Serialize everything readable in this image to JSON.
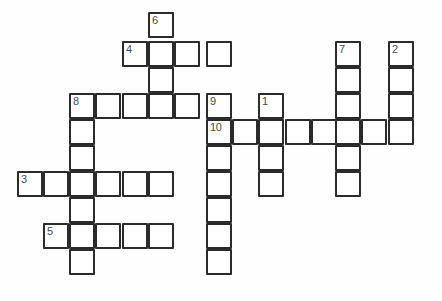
{
  "puzzle": {
    "title": "Crossword Grid",
    "type": "crossword",
    "canvas": {
      "width": 442,
      "height": 301,
      "background": "#fefefe"
    },
    "cell": {
      "size": 26,
      "pitch_x": 26.3,
      "pitch_y": 26.2,
      "border_color": "#2b2b2b",
      "fill_color": "#ffffff",
      "number_color": "#4a4a4a"
    },
    "origin": {
      "x": 17,
      "y": 12
    },
    "columns_px": [
      17,
      43,
      69,
      95,
      122,
      148,
      174,
      206,
      232,
      258,
      285,
      311,
      335,
      361,
      388
    ],
    "rows_px": [
      12,
      41,
      67,
      93,
      119,
      145,
      171,
      197,
      223,
      249
    ],
    "numbers_visible": [
      "1",
      "2",
      "3",
      "4",
      "5",
      "6",
      "7",
      "8",
      "9",
      "10"
    ],
    "entries": [
      {
        "number": "6",
        "direction": "down",
        "start": {
          "col": 5,
          "row": 0
        },
        "length": 3
      },
      {
        "number": "4",
        "direction": "across",
        "start": {
          "col": 4,
          "row": 1
        },
        "length": 4
      },
      {
        "number": "7",
        "direction": "down",
        "start": {
          "col": 12,
          "row": 1
        },
        "length": 6
      },
      {
        "number": "2",
        "direction": "down",
        "start": {
          "col": 14,
          "row": 1
        },
        "length": 4
      },
      {
        "number": "8",
        "direction": "across",
        "start": {
          "col": 2,
          "row": 3
        },
        "length": 5
      },
      {
        "number": "8",
        "direction": "down",
        "start": {
          "col": 2,
          "row": 3
        },
        "length": 7
      },
      {
        "number": "9",
        "direction": "down",
        "start": {
          "col": 7,
          "row": 3
        },
        "length": 7
      },
      {
        "number": "1",
        "direction": "down",
        "start": {
          "col": 9,
          "row": 3
        },
        "length": 4
      },
      {
        "number": "10",
        "direction": "across",
        "start": {
          "col": 7,
          "row": 4
        },
        "length": 8
      },
      {
        "number": "3",
        "direction": "across",
        "start": {
          "col": 0,
          "row": 6
        },
        "length": 6
      },
      {
        "number": "5",
        "direction": "across",
        "start": {
          "col": 1,
          "row": 8
        },
        "length": 5
      }
    ],
    "cells": [
      {
        "col": 5,
        "row": 0,
        "number": "6",
        "letter": ""
      },
      {
        "col": 4,
        "row": 1,
        "number": "4",
        "letter": ""
      },
      {
        "col": 5,
        "row": 1,
        "number": "",
        "letter": ""
      },
      {
        "col": 6,
        "row": 1,
        "number": "",
        "letter": ""
      },
      {
        "col": 7,
        "row": 1,
        "number": "",
        "letter": ""
      },
      {
        "col": 12,
        "row": 1,
        "number": "7",
        "letter": ""
      },
      {
        "col": 14,
        "row": 1,
        "number": "2",
        "letter": ""
      },
      {
        "col": 5,
        "row": 2,
        "number": "",
        "letter": ""
      },
      {
        "col": 12,
        "row": 2,
        "number": "",
        "letter": ""
      },
      {
        "col": 14,
        "row": 2,
        "number": "",
        "letter": ""
      },
      {
        "col": 2,
        "row": 3,
        "number": "8",
        "letter": ""
      },
      {
        "col": 3,
        "row": 3,
        "number": "",
        "letter": ""
      },
      {
        "col": 4,
        "row": 3,
        "number": "",
        "letter": ""
      },
      {
        "col": 5,
        "row": 3,
        "number": "",
        "letter": ""
      },
      {
        "col": 6,
        "row": 3,
        "number": "",
        "letter": ""
      },
      {
        "col": 7,
        "row": 3,
        "number": "9",
        "letter": ""
      },
      {
        "col": 9,
        "row": 3,
        "number": "1",
        "letter": ""
      },
      {
        "col": 12,
        "row": 3,
        "number": "",
        "letter": ""
      },
      {
        "col": 14,
        "row": 3,
        "number": "",
        "letter": ""
      },
      {
        "col": 2,
        "row": 4,
        "number": "",
        "letter": ""
      },
      {
        "col": 7,
        "row": 4,
        "number": "10",
        "letter": ""
      },
      {
        "col": 8,
        "row": 4,
        "number": "",
        "letter": ""
      },
      {
        "col": 9,
        "row": 4,
        "number": "",
        "letter": ""
      },
      {
        "col": 10,
        "row": 4,
        "number": "",
        "letter": ""
      },
      {
        "col": 11,
        "row": 4,
        "number": "",
        "letter": ""
      },
      {
        "col": 12,
        "row": 4,
        "number": "",
        "letter": ""
      },
      {
        "col": 13,
        "row": 4,
        "number": "",
        "letter": ""
      },
      {
        "col": 14,
        "row": 4,
        "number": "",
        "letter": ""
      },
      {
        "col": 2,
        "row": 5,
        "number": "",
        "letter": ""
      },
      {
        "col": 7,
        "row": 5,
        "number": "",
        "letter": ""
      },
      {
        "col": 9,
        "row": 5,
        "number": "",
        "letter": ""
      },
      {
        "col": 12,
        "row": 5,
        "number": "",
        "letter": ""
      },
      {
        "col": 0,
        "row": 6,
        "number": "3",
        "letter": ""
      },
      {
        "col": 1,
        "row": 6,
        "number": "",
        "letter": ""
      },
      {
        "col": 2,
        "row": 6,
        "number": "",
        "letter": ""
      },
      {
        "col": 3,
        "row": 6,
        "number": "",
        "letter": ""
      },
      {
        "col": 4,
        "row": 6,
        "number": "",
        "letter": ""
      },
      {
        "col": 5,
        "row": 6,
        "number": "",
        "letter": ""
      },
      {
        "col": 7,
        "row": 6,
        "number": "",
        "letter": ""
      },
      {
        "col": 9,
        "row": 6,
        "number": "",
        "letter": ""
      },
      {
        "col": 12,
        "row": 6,
        "number": "",
        "letter": ""
      },
      {
        "col": 2,
        "row": 7,
        "number": "",
        "letter": ""
      },
      {
        "col": 7,
        "row": 7,
        "number": "",
        "letter": ""
      },
      {
        "col": 1,
        "row": 8,
        "number": "5",
        "letter": ""
      },
      {
        "col": 2,
        "row": 8,
        "number": "",
        "letter": ""
      },
      {
        "col": 3,
        "row": 8,
        "number": "",
        "letter": ""
      },
      {
        "col": 4,
        "row": 8,
        "number": "",
        "letter": ""
      },
      {
        "col": 5,
        "row": 8,
        "number": "",
        "letter": ""
      },
      {
        "col": 7,
        "row": 8,
        "number": "",
        "letter": ""
      },
      {
        "col": 2,
        "row": 9,
        "number": "",
        "letter": ""
      },
      {
        "col": 7,
        "row": 9,
        "number": "",
        "letter": ""
      }
    ]
  }
}
